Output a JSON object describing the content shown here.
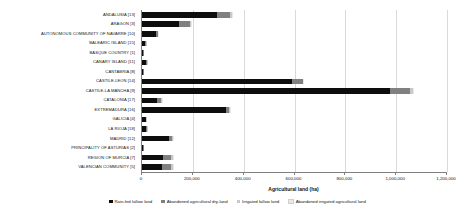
{
  "chart_data": {
    "type": "bar",
    "orientation": "horizontal",
    "stacked": true,
    "title": "",
    "xlabel": "Agricultural land (ha)",
    "ylabel": "",
    "xlim": [
      0,
      1200000
    ],
    "xticks": [
      "0",
      "200,000",
      "400,000",
      "600,000",
      "800,000",
      "1,000,000",
      "1,200,000"
    ],
    "xtick_values": [
      0,
      200000,
      400000,
      600000,
      800000,
      1000000,
      1200000
    ],
    "grid": true,
    "legend_position": "bottom",
    "categories": [
      "ANDALUSIA [13]",
      "ARAGON [3]",
      "AUTONOMOUS COMMUNITY OF NAVARRE [10]",
      "BALEARIC ISLAND [15]",
      "BASQUE COUNTRY [1]",
      "CANARY ISLAND [11]",
      "CANTABRIA [8]",
      "CASTILE-LEON [14]",
      "CASTILE-LA MANCHA [9]",
      "CATALONIA [17]",
      "EXTREMADURA [16]",
      "GALICIA [4]",
      "LA RIOJA [18]",
      "MADRID [12]",
      "PRINCIPALITY OF ASTURIAS [2]",
      "REGION OF MURCIA [7]",
      "VALENCIAN COMMUNITY [5]"
    ],
    "series": [
      {
        "name": "Rain-fed fallow land",
        "color": "#0d0d0d",
        "values": [
          297000,
          145000,
          56000,
          12000,
          4000,
          14000,
          3000,
          592000,
          976000,
          60000,
          329000,
          14000,
          14000,
          106000,
          5000,
          82000,
          78000
        ]
      },
      {
        "name": "Abandoned agricultural dry-land",
        "color": "#808080",
        "values": [
          49000,
          43000,
          6000,
          2000,
          1000,
          4000,
          1000,
          40000,
          79000,
          15000,
          12000,
          2000,
          4000,
          14000,
          1000,
          34000,
          36000
        ]
      },
      {
        "name": "Irrigated fallow land",
        "color": "#c9c9c9",
        "values": [
          8000,
          3000,
          2000,
          500,
          300,
          1000,
          200,
          3000,
          11000,
          2000,
          4000,
          500,
          500,
          1000,
          200,
          6000,
          8000
        ]
      },
      {
        "name": "Abandoned irrigated agricultural land",
        "color": "#e8e8e8",
        "values": [
          2000,
          1000,
          500,
          200,
          100,
          300,
          100,
          1000,
          2000,
          500,
          1000,
          200,
          200,
          500,
          100,
          2000,
          2000
        ]
      }
    ]
  }
}
